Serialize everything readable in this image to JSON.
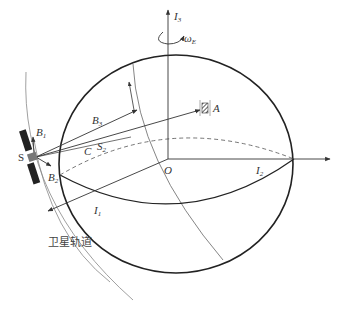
{
  "diagram": {
    "type": "satellite-earth-geometry",
    "labels": {
      "axis_z": "I",
      "axis_z_sub": "3",
      "omega": "ω",
      "omega_sub": "E",
      "axis_x": "I",
      "axis_x_sub": "2",
      "axis_y": "I",
      "axis_y_sub": "1",
      "origin": "O",
      "satellite": "S",
      "beam_b1": "B",
      "beam_b1_sub": "1",
      "beam_b2": "B",
      "beam_b2_sub": "2",
      "beam_b3": "B",
      "beam_b3_sub": "3",
      "point_c": "C",
      "point_s2": "S",
      "point_s2_sub": "2",
      "target_a": "A",
      "orbit_label": "卫星轨道"
    },
    "colors": {
      "earth_outline": "#222222",
      "lines": "#444444",
      "orbit": "#777777",
      "dashed": "#666666"
    }
  }
}
